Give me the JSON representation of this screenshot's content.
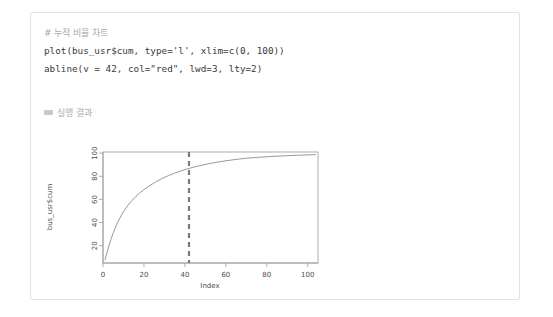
{
  "card": {
    "code": {
      "lines": [
        {
          "text": "# 누적 비율 차트",
          "kind": "comment"
        },
        {
          "text": "plot(bus_usr$cum, type='l', xlim=c(0, 100))",
          "kind": "code"
        },
        {
          "text": "abline(v = 42, col=\"red\", lwd=3, lty=2)",
          "kind": "code"
        }
      ]
    },
    "result": {
      "icon": "output-block-icon",
      "label": "실행 결과"
    }
  },
  "chart_data": {
    "type": "line",
    "title": "",
    "xlabel": "Index",
    "ylabel": "bus_usr$cum",
    "xlim": [
      0,
      105
    ],
    "ylim": [
      5,
      101
    ],
    "grid": false,
    "legend": null,
    "xticks": [
      0,
      20,
      40,
      60,
      80,
      100
    ],
    "yticks": [
      20,
      40,
      60,
      80,
      100
    ],
    "series": [
      {
        "name": "bus_usr$cum",
        "color": "#8d8d8d",
        "x": [
          1,
          2,
          3,
          4,
          5,
          6,
          7,
          8,
          9,
          10,
          12,
          14,
          16,
          18,
          20,
          23,
          26,
          29,
          32,
          35,
          38,
          41,
          44,
          48,
          52,
          56,
          60,
          65,
          70,
          75,
          80,
          85,
          90,
          95,
          100,
          104
        ],
        "y": [
          7.5,
          14.5,
          20.5,
          26.0,
          31.0,
          35.5,
          39.5,
          43.0,
          46.3,
          49.3,
          54.5,
          58.8,
          62.5,
          65.7,
          68.5,
          72.2,
          75.4,
          78.2,
          80.6,
          82.7,
          84.6,
          86.3,
          87.8,
          89.5,
          91.0,
          92.3,
          93.4,
          94.6,
          95.6,
          96.3,
          96.9,
          97.4,
          97.8,
          98.2,
          98.5,
          98.7
        ]
      }
    ],
    "annotations": [
      {
        "kind": "vline",
        "name": "threshold-line",
        "x": 42,
        "color": "#7a7a7a",
        "linewidth": 3,
        "linestyle": "dashed"
      }
    ]
  }
}
